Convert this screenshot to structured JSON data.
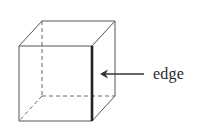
{
  "figure": {
    "type": "cube-diagram",
    "label": "edge",
    "colors": {
      "stroke": "#555555",
      "highlight_edge": "#222222",
      "hidden_edge": "#666666",
      "arrow": "#333333",
      "background": "#ffffff"
    },
    "annotation": {
      "text": "edge",
      "points_to": "front-right vertical edge"
    }
  }
}
